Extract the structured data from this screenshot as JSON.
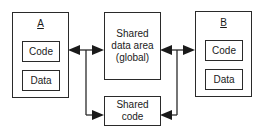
{
  "diagram": {
    "process_a": {
      "label": "A",
      "code_label": "Code",
      "data_label": "Data"
    },
    "process_b": {
      "label": "B",
      "code_label": "Code",
      "data_label": "Data"
    },
    "shared_data": {
      "label": "Shared\ndata area\n(global)"
    },
    "shared_code": {
      "label": "Shared\ncode"
    },
    "connections": [
      {
        "from": "A",
        "to": "Shared data area (global)",
        "bidirectional": true
      },
      {
        "from": "A",
        "to": "Shared code",
        "bidirectional": false
      },
      {
        "from": "B",
        "to": "Shared data area (global)",
        "bidirectional": true
      },
      {
        "from": "B",
        "to": "Shared code",
        "bidirectional": false
      }
    ],
    "colors": {
      "stroke": "#2a2a2a",
      "background": "#ffffff"
    }
  }
}
